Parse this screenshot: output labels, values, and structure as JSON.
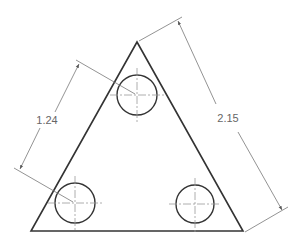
{
  "drawing": {
    "title": "Triangular plate with three holes",
    "colors": {
      "outline": "#333333",
      "dimension": "#777777",
      "centerline": "#999999",
      "text": "#666666"
    },
    "dimensions": [
      {
        "id": "hole-spacing",
        "label": "1.24"
      },
      {
        "id": "side-length",
        "label": "2.15"
      }
    ],
    "holes": 3
  }
}
